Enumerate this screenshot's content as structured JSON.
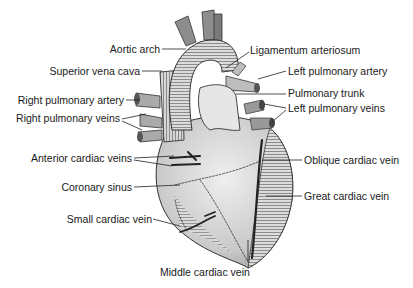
{
  "diagram": {
    "labels_left": [
      {
        "id": "aortic-arch",
        "text": "Aortic arch"
      },
      {
        "id": "superior-vena-cava",
        "text": "Superior vena cava"
      },
      {
        "id": "right-pulmonary-artery",
        "text": "Right pulmonary artery"
      },
      {
        "id": "right-pulmonary-veins",
        "text": "Right pulmonary veins"
      },
      {
        "id": "anterior-cardiac-veins",
        "text": "Anterior cardiac veins"
      },
      {
        "id": "coronary-sinus",
        "text": "Coronary sinus"
      },
      {
        "id": "small-cardiac-vein",
        "text": "Small cardiac vein"
      }
    ],
    "labels_right": [
      {
        "id": "ligamentum-arteriosum",
        "text": "Ligamentum arteriosum"
      },
      {
        "id": "left-pulmonary-artery",
        "text": "Left pulmonary artery"
      },
      {
        "id": "pulmonary-trunk",
        "text": "Pulmonary trunk"
      },
      {
        "id": "left-pulmonary-veins",
        "text": "Left pulmonary veins"
      },
      {
        "id": "oblique-cardiac-vein",
        "text": "Oblique cardiac vein"
      },
      {
        "id": "great-cardiac-vein",
        "text": "Great cardiac vein"
      }
    ],
    "labels_bottom": [
      {
        "id": "middle-cardiac-vein",
        "text": "Middle cardiac vein"
      }
    ]
  }
}
